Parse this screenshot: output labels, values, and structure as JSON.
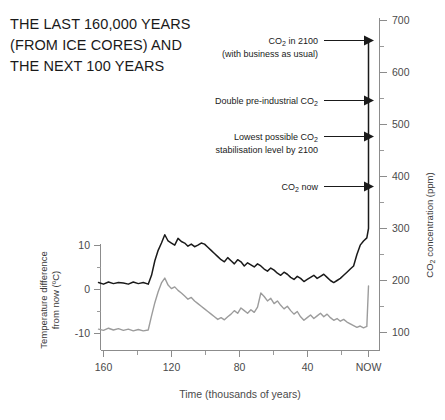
{
  "title": {
    "lines": [
      "THE LAST 160,000 YEARS",
      "(FROM ICE CORES) AND",
      "THE NEXT 100 YEARS"
    ]
  },
  "chart_data": {
    "type": "line",
    "title": "THE LAST 160,000 YEARS (FROM ICE CORES) AND THE NEXT 100 YEARS",
    "xlabel": "Time (thousands of years)",
    "x_tick_labels": [
      "160",
      "120",
      "80",
      "40",
      "NOW"
    ],
    "x_tick_values": [
      160,
      120,
      80,
      40,
      0
    ],
    "xlim": [
      165,
      -4
    ],
    "grid": false,
    "legend_position": "none",
    "axes": [
      {
        "id": "left",
        "label_line1": "Temperature difference",
        "label_line2": "from now (ºC)",
        "unit": "ºC",
        "ticks_major": [
          10,
          0,
          -10
        ],
        "ticks_minor": [
          5,
          -5
        ],
        "ylim": [
          15,
          -14
        ]
      },
      {
        "id": "right",
        "label": "CO₂ concentration (ppm)",
        "unit": "ppm",
        "ticks_major": [
          700,
          600,
          500,
          400,
          300,
          200,
          100
        ],
        "ticks_minor": [
          650,
          550,
          450,
          350,
          250,
          150
        ],
        "ylim": [
          730,
          85
        ]
      }
    ],
    "series": [
      {
        "name": "CO2 concentration",
        "axis": "right",
        "color": "#1a1a1a",
        "unit": "ppm",
        "x": [
          163,
          160,
          157,
          154,
          151,
          148,
          145,
          142,
          139,
          136,
          133,
          131,
          129,
          127,
          125,
          123,
          121,
          119,
          117,
          115,
          113,
          111,
          109,
          107,
          105,
          103,
          101,
          99,
          97,
          95,
          93,
          91,
          89,
          87,
          85,
          83,
          81,
          79,
          77,
          75,
          73,
          71,
          69,
          67,
          65,
          63,
          61,
          59,
          57,
          55,
          53,
          51,
          49,
          47,
          45,
          43,
          41,
          39,
          37,
          35,
          33,
          31,
          29,
          27,
          25,
          23,
          21,
          19,
          17,
          15,
          13,
          11,
          9,
          7,
          5,
          3,
          1,
          0,
          0,
          0
        ],
        "y": [
          196,
          193,
          197,
          194,
          196,
          195,
          193,
          197,
          194,
          196,
          193,
          210,
          238,
          258,
          272,
          288,
          276,
          272,
          268,
          281,
          275,
          272,
          266,
          270,
          265,
          268,
          272,
          270,
          264,
          258,
          252,
          246,
          240,
          236,
          244,
          238,
          232,
          240,
          236,
          228,
          234,
          230,
          226,
          232,
          228,
          222,
          218,
          224,
          220,
          214,
          210,
          216,
          212,
          206,
          202,
          208,
          204,
          198,
          202,
          206,
          210,
          204,
          208,
          212,
          206,
          200,
          196,
          200,
          204,
          210,
          216,
          222,
          228,
          250,
          268,
          276,
          282,
          300,
          420,
          660
        ]
      },
      {
        "name": "Temperature difference from now",
        "axis": "left",
        "color": "#9c9c9c",
        "unit": "ºC",
        "x": [
          163,
          160,
          157,
          154,
          151,
          148,
          145,
          142,
          139,
          136,
          133,
          131,
          129,
          127,
          125,
          123,
          121,
          119,
          117,
          115,
          113,
          111,
          109,
          107,
          105,
          103,
          101,
          99,
          97,
          95,
          93,
          91,
          89,
          87,
          85,
          83,
          81,
          79,
          77,
          75,
          73,
          71,
          69,
          67,
          65,
          63,
          61,
          59,
          57,
          55,
          53,
          51,
          49,
          47,
          45,
          43,
          41,
          39,
          37,
          35,
          33,
          31,
          29,
          27,
          25,
          23,
          21,
          19,
          17,
          15,
          13,
          11,
          9,
          7,
          5,
          3,
          1,
          0
        ],
        "y": [
          -9.0,
          -9.3,
          -8.8,
          -9.2,
          -8.9,
          -9.3,
          -9.0,
          -9.4,
          -9.1,
          -9.4,
          -9.2,
          -6.0,
          -3.0,
          -0.5,
          1.5,
          2.6,
          1.0,
          0.2,
          0.6,
          -0.2,
          -0.8,
          -1.5,
          -2.2,
          -1.8,
          -2.6,
          -3.2,
          -3.8,
          -4.4,
          -5.0,
          -5.6,
          -6.2,
          -6.8,
          -6.4,
          -6.9,
          -6.2,
          -5.6,
          -4.8,
          -5.4,
          -4.2,
          -4.8,
          -5.4,
          -4.6,
          -5.2,
          -4.0,
          -0.8,
          -1.6,
          -2.6,
          -2.0,
          -3.2,
          -2.6,
          -3.6,
          -4.4,
          -3.8,
          -4.8,
          -5.6,
          -5.0,
          -6.2,
          -7.0,
          -6.4,
          -5.8,
          -6.6,
          -6.0,
          -5.4,
          -6.2,
          -5.6,
          -6.4,
          -7.0,
          -6.6,
          -7.2,
          -6.8,
          -7.4,
          -7.8,
          -8.2,
          -8.6,
          -8.3,
          -8.7,
          -8.4,
          0.8
        ]
      }
    ],
    "annotations": [
      {
        "id": "co2-2100",
        "lines": [
          "CO₂ in 2100",
          "(with business as usual)"
        ],
        "value": 660,
        "unit": "ppm"
      },
      {
        "id": "double-preindustrial",
        "lines": [
          "Double pre-industrial CO₂"
        ],
        "value": 560,
        "unit": "ppm"
      },
      {
        "id": "lowest-stabilisation",
        "lines": [
          "Lowest possible CO₂",
          "stabilisation level by 2100"
        ],
        "value": 480,
        "unit": "ppm"
      },
      {
        "id": "co2-now",
        "lines": [
          "CO₂ now"
        ],
        "value": 390,
        "unit": "ppm"
      }
    ]
  }
}
